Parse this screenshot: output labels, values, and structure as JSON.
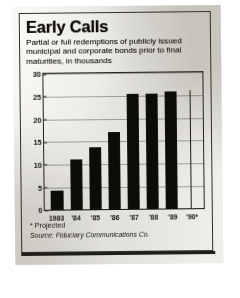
{
  "clipping": {
    "title": "Early Calls",
    "subtitle": "Partial or full redemptions of publicly issued municipal and corporate bonds prior to final maturities, in thousands",
    "footnote": "* Projected",
    "source": "Source: Fiduciary Communications Co."
  },
  "chart_data": {
    "type": "bar",
    "title": "Early Calls",
    "subtitle": "Partial or full redemptions of publicly issued municipal and corporate bonds prior to final maturities, in thousands",
    "categories": [
      "1983",
      "'84",
      "'85",
      "'86",
      "'87",
      "'88",
      "'89",
      "'90*"
    ],
    "values": [
      4.3,
      11.0,
      13.7,
      17.0,
      25.5,
      25.5,
      25.8,
      26.0
    ],
    "xlabel": "",
    "ylabel": "in thousands",
    "ylim": [
      0,
      30
    ],
    "yticks": [
      0,
      5,
      10,
      15,
      20,
      25,
      30
    ],
    "ytick_labels": [
      "0",
      "5",
      "10",
      "15",
      "20",
      "25",
      "30"
    ],
    "grid": true,
    "legend": false,
    "bar_color": "#1a1915",
    "note": "* Projected",
    "source": "Source: Fiduciary Communications Co."
  }
}
